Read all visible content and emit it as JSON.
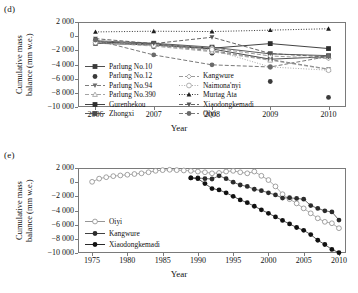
{
  "figure": {
    "panels": [
      {
        "label": "(d)",
        "ylabel": "Cumulative mass\nbalance (mm w.e.)",
        "ylabel_line1": "Cumulative mass",
        "ylabel_line2": "balance (mm w.e.)",
        "xlabel": "Year"
      },
      {
        "label": "(e)",
        "ylabel_line1": "Cumulative mass",
        "ylabel_line2": "balance (mm w.e.)",
        "xlabel": "Year"
      }
    ]
  },
  "chart_data": [
    {
      "type": "line",
      "panel": "(d)",
      "title": "",
      "xlabel": "Year",
      "ylabel": "Cumulative mass balance (mm w.e.)",
      "x": [
        2006,
        2007,
        2008,
        2009,
        2010
      ],
      "xticklabels": [
        "2006",
        "2007",
        "2008",
        "2009",
        "2010"
      ],
      "xlim": [
        2005.7,
        2010.3
      ],
      "ylim": [
        -10000,
        2000
      ],
      "yticks": [
        2000,
        0,
        -2000,
        -4000,
        -6000,
        -8000,
        -10000
      ],
      "yticklabels": [
        "2 000",
        "0",
        "-2 000",
        "-4 000",
        "-6 000",
        "-8 000",
        "-10 000"
      ],
      "grid": false,
      "legend_position": "lower-left-inside",
      "series": [
        {
          "name": "Parlung No.10",
          "marker": "filled-square",
          "line": "solid",
          "color": "#3a3a3a",
          "values": [
            -1000,
            -1250,
            -1800,
            -3250,
            -2900
          ]
        },
        {
          "name": "Parlung No.12",
          "marker": "filled-circle",
          "line": "none",
          "color": "#3a3a3a",
          "values": [
            -1000,
            -1500,
            -2400,
            -6400,
            -8650
          ]
        },
        {
          "name": "Parlung No.94",
          "marker": "filled-triangle-down",
          "line": "dashed",
          "color": "#6d6d6d",
          "values": [
            -700,
            -1250,
            -2050,
            -3300,
            -4650
          ]
        },
        {
          "name": "Parlung No.390",
          "marker": "open-triangle-up",
          "line": "dashed",
          "color": "#9a9a9a",
          "values": [
            -900,
            -1400,
            -2200,
            -3400,
            -4700
          ]
        },
        {
          "name": "Gurenhekou",
          "marker": "filled-square",
          "line": "solid",
          "color": "#2e2e2e",
          "values": [
            -800,
            -1100,
            -1700,
            -1050,
            -1750
          ]
        },
        {
          "name": "Zhongxi",
          "marker": "filled-square",
          "line": "solid",
          "color": "#4a4a4a",
          "values": [
            -650,
            -1000,
            -1550,
            -2500,
            -2750
          ]
        },
        {
          "name": "Kangwure",
          "marker": "open-diamond",
          "line": "dashed",
          "color": "#8f8f8f",
          "values": [
            -650,
            -1150,
            -1650,
            -2800,
            -3150
          ]
        },
        {
          "name": "Naimona'nyi",
          "marker": "open-circle",
          "line": "dotted",
          "color": "#9e9e9e",
          "values": [
            -900,
            -1300,
            -1900,
            -4350,
            -4800
          ]
        },
        {
          "name": "Murtag Ata",
          "marker": "filled-triangle-up",
          "line": "dotted",
          "color": "#1f1f1f",
          "values": [
            600,
            700,
            650,
            850,
            1050
          ]
        },
        {
          "name": "Xiaodongkemadi",
          "marker": "filled-triangle-down",
          "line": "dashed",
          "color": "#555555",
          "values": [
            -350,
            -1050,
            -150,
            -2450,
            -2950
          ]
        },
        {
          "name": "Oiyi",
          "marker": "filled-circle",
          "line": "dashed",
          "color": "#6a6a6a",
          "values": [
            -550,
            -2650,
            -4050,
            -4350,
            -2850
          ]
        }
      ],
      "legend": [
        "Parlung No.10",
        "Parlung No.12",
        "Parlung No.94",
        "Parlung No.390",
        "Gurenhekou",
        "Zhongxi",
        "Kangwure",
        "Naimona'nyi",
        "Murtag Ata",
        "Xiaodongkemadi",
        "Oiyi"
      ]
    },
    {
      "type": "line",
      "panel": "(e)",
      "title": "",
      "xlabel": "Year",
      "ylabel": "Cumulative mass balance (mm w.e.)",
      "xlim": [
        1973,
        2011
      ],
      "ylim": [
        -10000,
        2000
      ],
      "xticks": [
        1975,
        1980,
        1985,
        1990,
        1995,
        2000,
        2005,
        2010
      ],
      "xticklabels": [
        "1975",
        "1980",
        "1985",
        "1990",
        "1995",
        "2000",
        "2005",
        "2010"
      ],
      "yticks": [
        2000,
        0,
        -2000,
        -4000,
        -6000,
        -8000,
        -10000
      ],
      "yticklabels": [
        "2 000",
        "0",
        "-2 000",
        "-4 000",
        "-6 000",
        "-8 000",
        "-10 000"
      ],
      "grid": false,
      "legend_position": "lower-left-inside",
      "legend": [
        "Oiyi",
        "Kangwure",
        "Xiaodongkemadi"
      ],
      "series": [
        {
          "name": "Oiyi",
          "marker": "open-circle",
          "line": "solid-thin",
          "color": "#8a8a8a",
          "x": [
            1975,
            1976,
            1977,
            1978,
            1979,
            1980,
            1981,
            1982,
            1983,
            1984,
            1985,
            1986,
            1987,
            1988,
            1989,
            1990,
            1991,
            1992,
            1993,
            1994,
            1995,
            1996,
            1997,
            1998,
            1999,
            2000,
            2001,
            2002,
            2003,
            2004,
            2005,
            2006,
            2007,
            2008,
            2009,
            2010
          ],
          "values": [
            50,
            500,
            700,
            850,
            950,
            1050,
            1150,
            1250,
            1400,
            1600,
            1700,
            1750,
            1700,
            1650,
            1600,
            1500,
            1400,
            1250,
            1300,
            1500,
            1600,
            1400,
            1250,
            1500,
            900,
            300,
            -600,
            -1700,
            -2400,
            -3000,
            -3700,
            -4400,
            -5100,
            -5600,
            -5800,
            -6500
          ]
        },
        {
          "name": "Kangwure",
          "marker": "filled-circle",
          "line": "solid-thin",
          "color": "#2b2b2b",
          "x": [
            1989,
            1990,
            1991,
            1992,
            1993,
            1994,
            1995,
            1996,
            1997,
            1998,
            1999,
            2000,
            2001,
            2002,
            2003,
            2004,
            2005,
            2006,
            2007,
            2008,
            2009,
            2010
          ],
          "values": [
            600,
            600,
            500,
            450,
            900,
            500,
            0,
            -400,
            -600,
            -1000,
            -1200,
            -1500,
            -1800,
            -2250,
            -2200,
            -2300,
            -2400,
            -3300,
            -3700,
            -4050,
            -4200,
            -5350
          ]
        },
        {
          "name": "Xiaodongkemadi",
          "marker": "filled-circle",
          "line": "solid-thin",
          "color": "#111111",
          "x": [
            1989,
            1990,
            1991,
            1992,
            1993,
            1994,
            1995,
            1996,
            1997,
            1998,
            1999,
            2000,
            2001,
            2002,
            2003,
            2004,
            2005,
            2006,
            2007,
            2008,
            2009,
            2010
          ],
          "values": [
            600,
            500,
            -200,
            -900,
            -1100,
            -1500,
            -2000,
            -2500,
            -2900,
            -3400,
            -3900,
            -4400,
            -4900,
            -5400,
            -5900,
            -6400,
            -6800,
            -7400,
            -8200,
            -8800,
            -9500,
            -9950
          ]
        }
      ]
    }
  ]
}
